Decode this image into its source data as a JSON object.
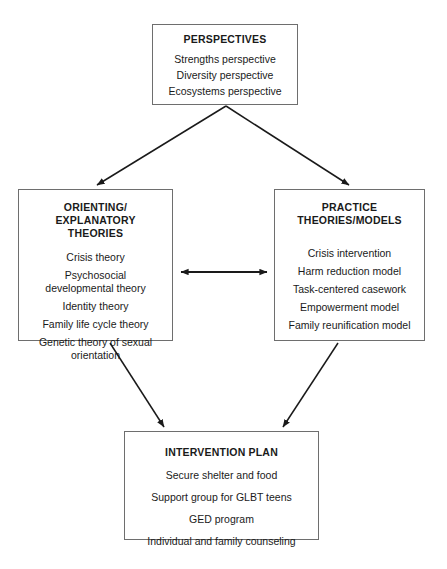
{
  "diagram": {
    "nodes": {
      "perspectives": {
        "title": "PERSPECTIVES",
        "items": [
          "Strengths perspective",
          "Diversity perspective",
          "Ecosystems perspective"
        ]
      },
      "orienting": {
        "title": "ORIENTING/\nEXPLANATORY\nTHEORIES",
        "items": [
          "Crisis theory",
          "Psychosocial\ndevelopmental theory",
          "Identity theory",
          "Family life cycle theory",
          "Genetic theory of sexual\norientation"
        ]
      },
      "practice": {
        "title": "PRACTICE\nTHEORIES/MODELS",
        "items": [
          "Crisis intervention",
          "Harm reduction model",
          "Task-centered casework",
          "Empowerment model",
          "Family reunification model"
        ]
      },
      "intervention": {
        "title": "INTERVENTION PLAN",
        "items": [
          "Secure shelter and food",
          "Support group for GLBT teens",
          "GED program",
          "Individual and family counseling"
        ]
      }
    },
    "edges": [
      {
        "name": "perspectives-to-orienting",
        "from": "perspectives",
        "to": "orienting",
        "style": "single-arrow"
      },
      {
        "name": "perspectives-to-practice",
        "from": "perspectives",
        "to": "practice",
        "style": "single-arrow"
      },
      {
        "name": "orienting-practice-bidirectional",
        "from": "orienting",
        "to": "practice",
        "style": "double-arrow"
      },
      {
        "name": "orienting-to-intervention",
        "from": "orienting",
        "to": "intervention",
        "style": "single-arrow"
      },
      {
        "name": "practice-to-intervention",
        "from": "practice",
        "to": "intervention",
        "style": "single-arrow"
      }
    ],
    "colors": {
      "background": "#ffffff",
      "box_border": "#6e6e6e",
      "text": "#1a1a1a",
      "connector": "#1a1a1a"
    }
  }
}
